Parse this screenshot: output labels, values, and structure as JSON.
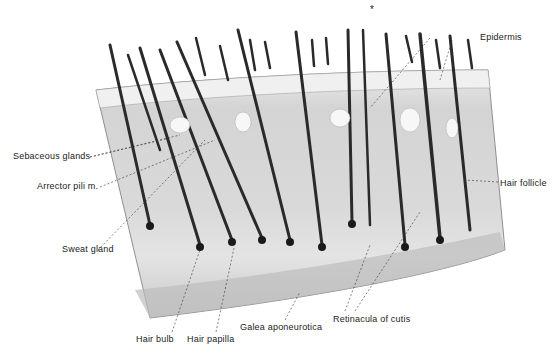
{
  "figure": {
    "star_marker": "*",
    "labels": {
      "epidermis": "Epidermis",
      "sebaceous_glands": "Sebaceous glands",
      "arrector_pili": "Arrector pili m.",
      "hair_follicle": "Hair follicle",
      "sweat_gland": "Sweat gland",
      "hair_bulb": "Hair bulb",
      "hair_papilla": "Hair papilla",
      "galea_aponeurotica": "Galea aponeurotica",
      "retinacula_cutis": "Retinacula of cutis"
    },
    "colors": {
      "background": "#ffffff",
      "tissue": "#dcdcdc",
      "dermis": "#e6e6e6",
      "hair": "#2a2a2a",
      "text": "#222222"
    }
  }
}
